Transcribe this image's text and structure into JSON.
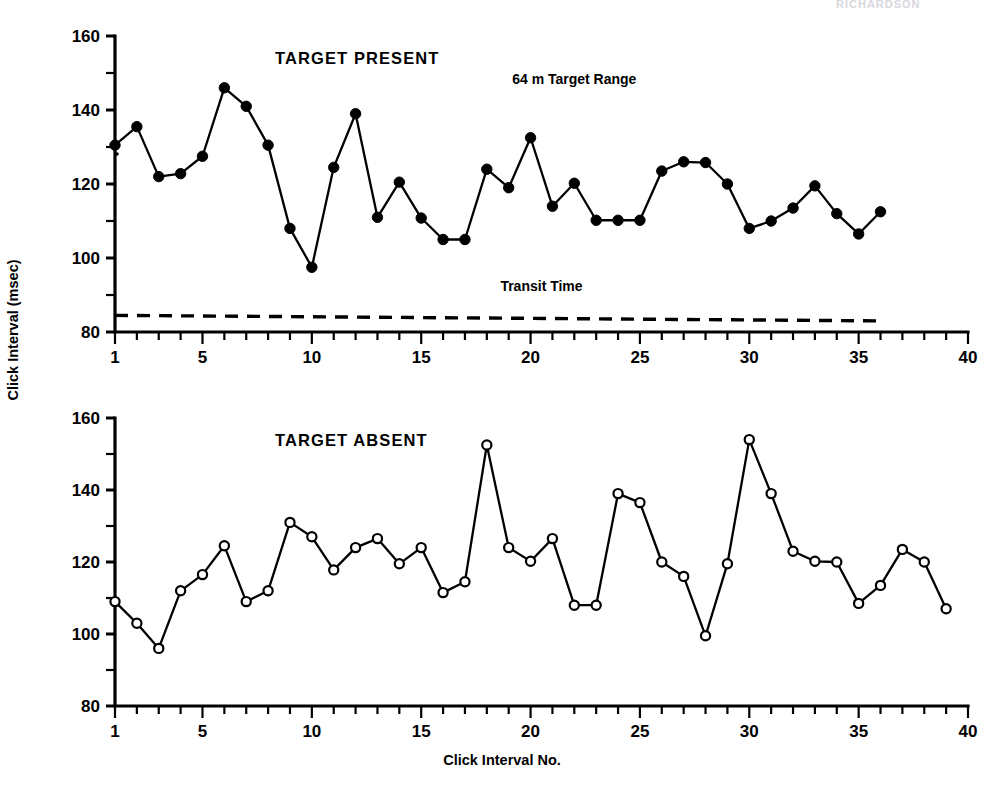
{
  "figure": {
    "header_fragment": "RICHARDSON",
    "y_axis_title": "Click Interval (msec)",
    "x_axis_title": "Click Interval No."
  },
  "chart_data": [
    {
      "type": "line",
      "title": "TARGET PRESENT",
      "panel": "top",
      "xlabel": "Click Interval No.",
      "ylabel": "Click Interval (msec)",
      "xlim": [
        1,
        40
      ],
      "ylim": [
        80,
        160
      ],
      "yticks": [
        80,
        100,
        120,
        140,
        160
      ],
      "yticks_minor": [
        90,
        110,
        130,
        150
      ],
      "xticks_labeled": [
        1,
        5,
        10,
        15,
        20,
        25,
        30,
        35,
        40
      ],
      "grid": false,
      "legend": null,
      "marker": "filled-circle",
      "annotations": [
        {
          "text": "64 m Target Range",
          "x": 22,
          "y": 147
        },
        {
          "text": "Transit Time",
          "x": 20.5,
          "y": 91
        }
      ],
      "reference_line": {
        "name": "Transit Time",
        "style": "dashed",
        "x_start": 1,
        "x_end": 36,
        "y_start": 84.5,
        "y_end": 83.0
      },
      "x": [
        1,
        2,
        3,
        4,
        5,
        6,
        7,
        8,
        9,
        10,
        11,
        12,
        13,
        14,
        15,
        16,
        17,
        18,
        19,
        20,
        21,
        22,
        23,
        24,
        25,
        26,
        27,
        28,
        29,
        30,
        31,
        32,
        33,
        34,
        35,
        36
      ],
      "values": [
        130.5,
        135.5,
        122.0,
        122.8,
        127.5,
        146.0,
        141.0,
        130.5,
        108.0,
        97.5,
        124.5,
        139.0,
        111.0,
        120.5,
        110.8,
        105.0,
        105.0,
        124.0,
        119.0,
        132.5,
        114.0,
        120.2,
        110.2,
        110.2,
        110.2,
        123.5,
        126.0,
        125.8,
        120.0,
        108.0,
        110.0,
        113.5,
        119.5,
        112.0,
        106.5,
        112.5
      ]
    },
    {
      "type": "line",
      "title": "TARGET ABSENT",
      "panel": "bottom",
      "xlabel": "Click Interval No.",
      "ylabel": "Click Interval (msec)",
      "xlim": [
        1,
        40
      ],
      "ylim": [
        80,
        160
      ],
      "yticks": [
        80,
        100,
        120,
        140,
        160
      ],
      "yticks_minor": [
        90,
        110,
        130,
        150
      ],
      "xticks_labeled": [
        1,
        5,
        10,
        15,
        20,
        25,
        30,
        35,
        40
      ],
      "grid": false,
      "legend": null,
      "marker": "open-circle",
      "annotations": [],
      "reference_line": null,
      "x": [
        1,
        2,
        3,
        4,
        5,
        6,
        7,
        8,
        9,
        10,
        11,
        12,
        13,
        14,
        15,
        16,
        17,
        18,
        19,
        20,
        21,
        22,
        23,
        24,
        25,
        26,
        27,
        28,
        29,
        30,
        31,
        32,
        33,
        34,
        35,
        36,
        37,
        38,
        39
      ],
      "values": [
        109.0,
        103.0,
        96.0,
        112.0,
        116.5,
        124.5,
        109.0,
        112.0,
        131.0,
        127.0,
        117.8,
        124.0,
        126.5,
        119.5,
        124.0,
        111.5,
        114.5,
        152.5,
        124.0,
        120.2,
        126.5,
        108.0,
        108.0,
        139.0,
        136.5,
        120.0,
        116.0,
        99.5,
        119.5,
        154.0,
        139.0,
        123.0,
        120.2,
        120.0,
        108.5,
        113.5,
        123.5,
        120.0,
        107.0
      ]
    }
  ]
}
